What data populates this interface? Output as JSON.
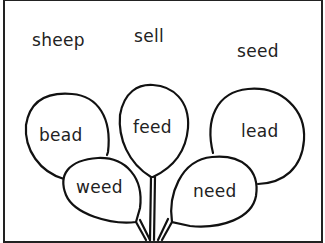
{
  "worksheet": {
    "free_words": [
      {
        "text": "sheep"
      },
      {
        "text": "sell"
      },
      {
        "text": "seed"
      }
    ],
    "balloons": [
      {
        "text": "bead"
      },
      {
        "text": "feed"
      },
      {
        "text": "lead"
      },
      {
        "text": "weed"
      },
      {
        "text": "need"
      }
    ],
    "colors": {
      "ink": "#222222",
      "paper": "#ffffff"
    }
  }
}
